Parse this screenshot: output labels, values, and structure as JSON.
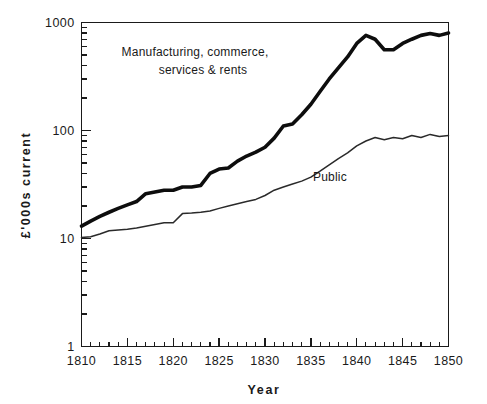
{
  "chart_data": {
    "type": "line",
    "title": "",
    "subtitle": "",
    "xlabel": "Year",
    "ylabel": "£'000s  current",
    "yscale": "log",
    "xscale": "linear",
    "xlim": [
      1810,
      1850
    ],
    "ylim": [
      1,
      1000
    ],
    "grid": false,
    "legend_position": "inline-annotations",
    "xticklabels": [
      "1810",
      "1815",
      "1820",
      "1825",
      "1830",
      "1835",
      "1840",
      "1845",
      "1850"
    ],
    "xtickvalues": [
      1810,
      1815,
      1820,
      1825,
      1830,
      1835,
      1840,
      1845,
      1850
    ],
    "xminor_tick_step": 1,
    "yticklabels": [
      "1000",
      "100",
      "10",
      "1"
    ],
    "ytickvalues": [
      1000,
      100,
      10,
      1
    ],
    "yminor_ticks": "log decade subdivisions 2-9",
    "x": [
      1810,
      1811,
      1812,
      1813,
      1814,
      1815,
      1816,
      1817,
      1818,
      1819,
      1820,
      1821,
      1822,
      1823,
      1824,
      1825,
      1826,
      1827,
      1828,
      1829,
      1830,
      1831,
      1832,
      1833,
      1834,
      1835,
      1836,
      1837,
      1838,
      1839,
      1840,
      1841,
      1842,
      1843,
      1844,
      1845,
      1846,
      1847,
      1848,
      1849,
      1850
    ],
    "series": [
      {
        "name": "Manufacturing, commerce, services & rents",
        "style": "thick",
        "annotation": "Manufacturing,  commerce,\nservices & rents",
        "values": [
          13,
          14.5,
          16,
          17.5,
          19,
          20.5,
          22,
          26,
          27,
          28,
          28,
          30,
          30,
          31,
          40,
          44,
          45,
          52,
          58,
          63,
          70,
          85,
          110,
          115,
          140,
          175,
          230,
          300,
          380,
          480,
          640,
          760,
          700,
          560,
          560,
          640,
          700,
          760,
          790,
          760,
          800
        ]
      },
      {
        "name": "Public",
        "style": "thin",
        "annotation": "Public",
        "values": [
          10.2,
          10.4,
          11,
          11.8,
          12,
          12.2,
          12.5,
          13,
          13.5,
          14,
          14,
          17,
          17.2,
          17.5,
          18,
          19,
          20,
          21,
          22,
          23,
          25,
          28,
          30,
          32,
          34,
          37,
          42,
          48,
          55,
          62,
          72,
          80,
          86,
          82,
          86,
          84,
          90,
          86,
          92,
          88,
          90
        ]
      }
    ],
    "annotations": [
      {
        "name": "manufacturing-label",
        "lines": [
          "Manufacturing,  commerce,",
          "services & rents"
        ],
        "x_px": 195,
        "y_px": 56,
        "anchor": "middle"
      },
      {
        "name": "public-label",
        "lines": [
          "Public"
        ],
        "x_px": 330,
        "y_px": 176,
        "anchor": "middle"
      }
    ]
  },
  "labels": {
    "x_axis_title": "Year",
    "y_axis_title": "£'000s  current",
    "series_manufacturing_line1": "Manufacturing,  commerce,",
    "series_manufacturing_line2": "services & rents",
    "series_public": "Public",
    "ytick_1000": "1000",
    "ytick_100": "100",
    "ytick_10": "10",
    "ytick_1": "1",
    "xtick_1810": "1810",
    "xtick_1815": "1815",
    "xtick_1820": "1820",
    "xtick_1825": "1825",
    "xtick_1830": "1830",
    "xtick_1835": "1835",
    "xtick_1840": "1840",
    "xtick_1845": "1845",
    "xtick_1850": "1850"
  },
  "colors": {
    "background": "#ffffff",
    "axis": "#1a1a1a",
    "series_thick": "#0d0d0d",
    "series_thin": "#2a2a2a",
    "text": "#1a1a1a"
  }
}
